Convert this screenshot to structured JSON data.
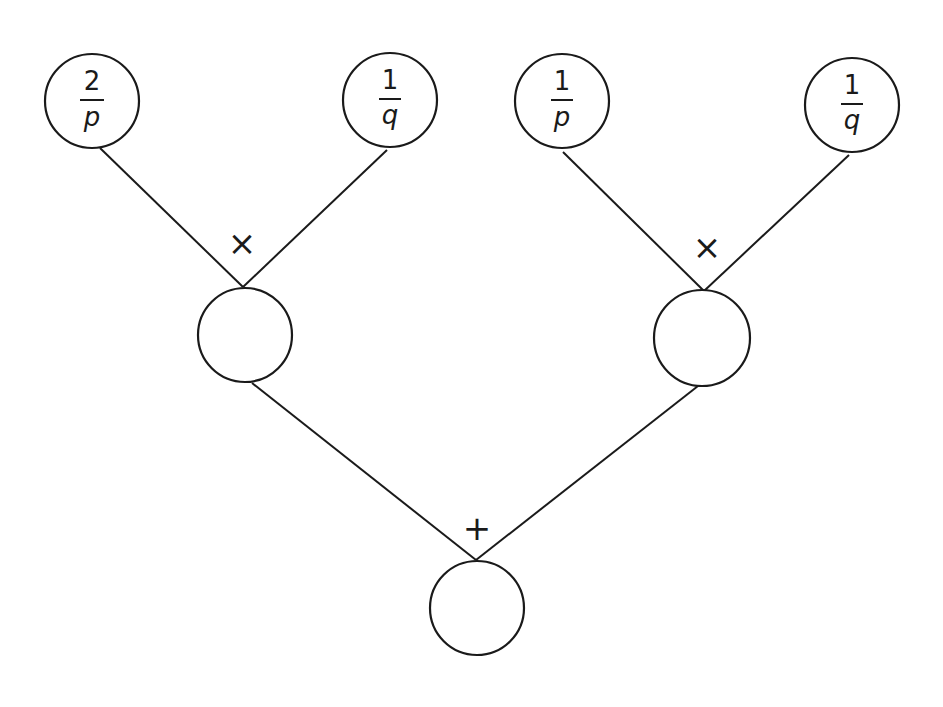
{
  "diagram": {
    "type": "probability tree / expression tree",
    "leaves": [
      {
        "id": "leaf-1",
        "numerator": "2",
        "denominator": "p"
      },
      {
        "id": "leaf-2",
        "numerator": "1",
        "denominator": "q"
      },
      {
        "id": "leaf-3",
        "numerator": "1",
        "denominator": "p"
      },
      {
        "id": "leaf-4",
        "numerator": "1",
        "denominator": "q"
      }
    ],
    "intermediate": [
      {
        "id": "mid-left",
        "operator": "×",
        "value": "",
        "children": [
          "leaf-1",
          "leaf-2"
        ]
      },
      {
        "id": "mid-right",
        "operator": "×",
        "value": "",
        "children": [
          "leaf-3",
          "leaf-4"
        ]
      }
    ],
    "root": {
      "id": "root",
      "operator": "+",
      "value": "",
      "children": [
        "mid-left",
        "mid-right"
      ]
    }
  }
}
